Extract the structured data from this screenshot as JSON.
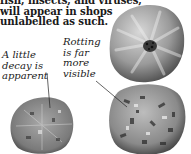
{
  "article": {
    "lines": [
      "fish, insects, and viruses,",
      "will appear in shops",
      "unlabelled as such."
    ]
  },
  "captions": {
    "left": {
      "lines": [
        "A little",
        "decay is",
        "apparent"
      ]
    },
    "right": {
      "lines": [
        "Rotting",
        "is far",
        "more",
        "visible"
      ]
    }
  },
  "illustrations": [
    {
      "name": "fresh-tomato",
      "description": "top view of a fresh tomato"
    },
    {
      "name": "slightly-decayed-tomato",
      "description": "tomato with a little decay"
    },
    {
      "name": "rotting-tomato",
      "description": "tomato with far more visible rotting"
    }
  ]
}
